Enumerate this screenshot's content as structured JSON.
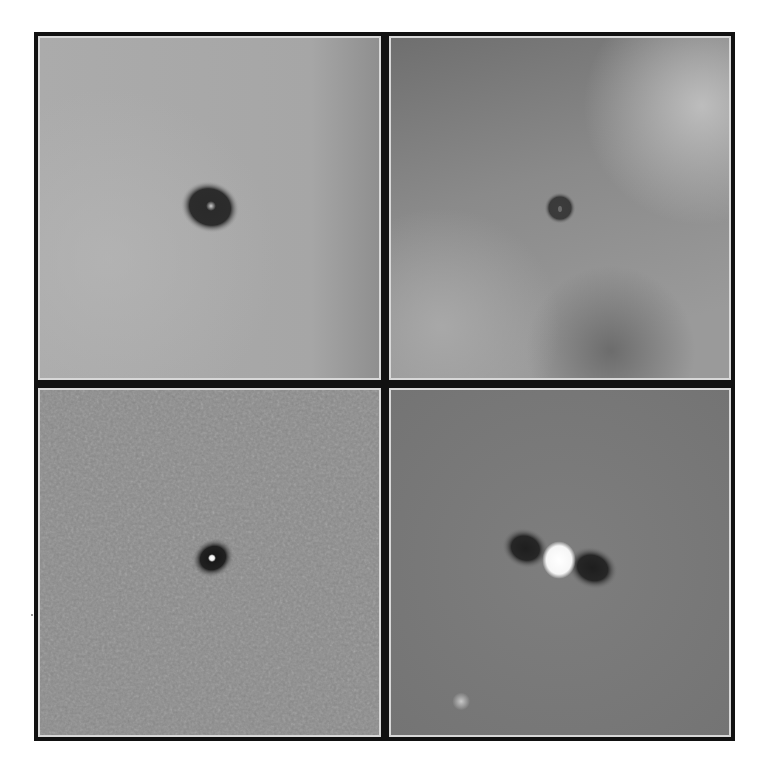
{
  "figure": {
    "layout": "2x2 grid of grayscale astronomical image panels",
    "frame_color": "#111111",
    "panel_border_color": "#d8d8d8",
    "panels": [
      {
        "position": "top-left",
        "background": "#a9a9a9",
        "feature": "dark elliptical halo with faint bright core",
        "center": [
          210,
          207
        ]
      },
      {
        "position": "top-right",
        "background": "#8e8e8e",
        "feature": "small dark ring, mottled background with bright upper-right patch",
        "center": [
          561,
          208
        ]
      },
      {
        "position": "bottom-left",
        "background": "#8a8a8a",
        "feature": "compact dark halo with bright point core, noisy background",
        "center": [
          211,
          558
        ]
      },
      {
        "position": "bottom-right",
        "background": "#7b7b7b",
        "feature": "bright white oval core flanked by dark lobes; faint secondary source lower-left",
        "center": [
          560,
          562
        ]
      }
    ]
  }
}
